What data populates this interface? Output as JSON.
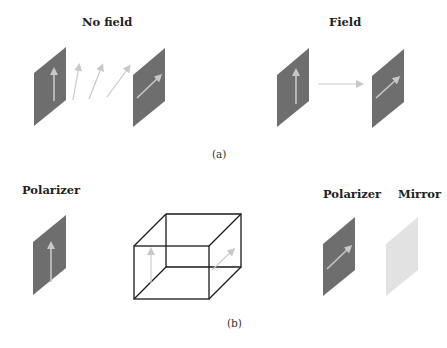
{
  "panel_a": {
    "caption": "(a)",
    "left": {
      "title": "No field",
      "elements": [
        "polarizer-vertical",
        "rotating-light-arrows",
        "polarizer-diagonal"
      ]
    },
    "right": {
      "title": "Field",
      "elements": [
        "polarizer-vertical",
        "light-propagation-arrow",
        "polarizer-diagonal"
      ]
    }
  },
  "panel_b": {
    "caption": "(b)",
    "labels": {
      "left_polarizer": "Polarizer",
      "right_polarizer": "Polarizer",
      "mirror": "Mirror"
    },
    "elements": [
      "polarizer-vertical",
      "liquid-crystal-cell-cube",
      "polarizer-diagonal",
      "mirror-plate"
    ]
  },
  "colors": {
    "polarizer_fill": "#6e6e6e",
    "arrow": "#c8c8c8",
    "mirror_fill": "#e2e2e2",
    "cube_edge": "#1a1a1a",
    "text": "#222222"
  }
}
